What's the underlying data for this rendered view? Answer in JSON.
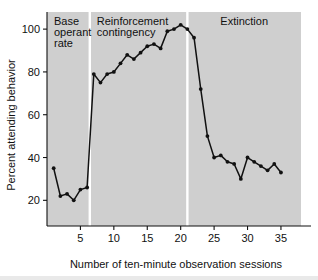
{
  "chart_data": {
    "type": "line",
    "title": "",
    "xlabel": "Number of ten-minute observation sessions",
    "ylabel": "Percent attending behavior",
    "xlim": [
      0,
      38
    ],
    "ylim": [
      8,
      108
    ],
    "xticks": [
      5,
      10,
      15,
      20,
      25,
      30,
      35
    ],
    "yticks": [
      20,
      40,
      60,
      80,
      100
    ],
    "grid": false,
    "legend": null,
    "series": [
      {
        "name": "Percent attending behavior",
        "x": [
          1,
          2,
          3,
          4,
          5,
          6,
          7,
          8,
          9,
          10,
          11,
          12,
          13,
          14,
          15,
          16,
          17,
          18,
          19,
          20,
          21,
          22,
          23,
          24,
          25,
          26,
          27,
          28,
          29,
          30,
          31,
          32,
          33,
          34,
          35
        ],
        "values": [
          35,
          22,
          23,
          20,
          25,
          26,
          79,
          75,
          79,
          80,
          84,
          88,
          86,
          89,
          92,
          93,
          91,
          99,
          100,
          102,
          100,
          96,
          72,
          50,
          40,
          41,
          38,
          37,
          30,
          40,
          38,
          36,
          34,
          37,
          33
        ]
      }
    ],
    "phases": [
      {
        "label": "Base operant rate",
        "label_lines": [
          "Base",
          "operant",
          "rate"
        ],
        "x_start": 0,
        "x_end": 6.4,
        "align": "left"
      },
      {
        "label": "Reinforcement contingency",
        "label_lines": [
          "Reinforcement",
          "contingency"
        ],
        "x_start": 6.4,
        "x_end": 21.0,
        "align": "left"
      },
      {
        "label": "Extinction",
        "label_lines": [
          "Extinction"
        ],
        "x_start": 21.0,
        "x_end": 38,
        "align": "center"
      }
    ],
    "phase_divider_positions": [
      6.4,
      21.0
    ],
    "colors": {
      "panel_background": "#cfcfcf",
      "page_background": "#ffffff",
      "line": "#111111",
      "divider": "#ffffff",
      "text": "#111111"
    }
  }
}
